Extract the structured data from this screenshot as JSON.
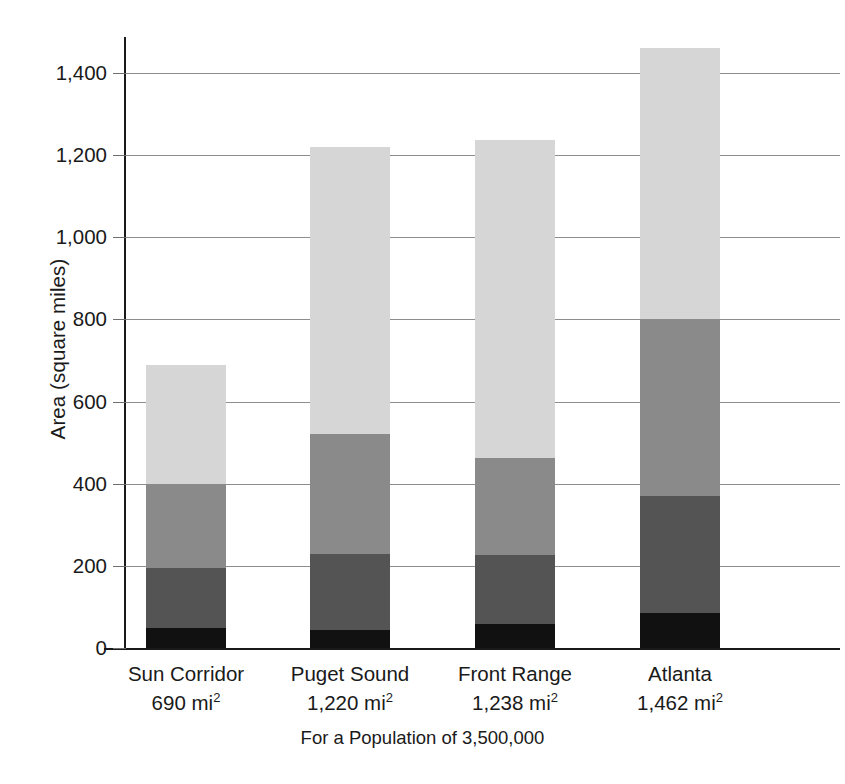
{
  "chart_data": {
    "type": "bar",
    "subtype": "stacked-bar",
    "title": "",
    "xlabel": "For a Population of 3,500,000",
    "ylabel": "Area (square miles)",
    "ylim": [
      0,
      1500
    ],
    "ytick_values": [
      0,
      200,
      400,
      600,
      800,
      1000,
      1200,
      1400
    ],
    "ytick_labels": [
      "0",
      "200",
      "400",
      "600",
      "800",
      "1,000",
      "1,200",
      "1,400"
    ],
    "grid": true,
    "legend": "none",
    "categories": [
      "Sun Corridor",
      "Puget Sound",
      "Front Range",
      "Atlanta"
    ],
    "category_sublabels": [
      "690 mi",
      "1,220 mi",
      "1,238 mi",
      "1,462 mi"
    ],
    "category_sublabel_unit_exponent": "2",
    "totals": [
      690,
      1220,
      1238,
      1462
    ],
    "series": [
      {
        "name": "segment-1",
        "color": "#111111",
        "values": [
          48,
          45,
          58,
          85
        ]
      },
      {
        "name": "segment-2",
        "color": "#545454",
        "values": [
          147,
          185,
          168,
          285
        ]
      },
      {
        "name": "segment-3",
        "color": "#8a8a8a",
        "values": [
          205,
          290,
          237,
          430
        ]
      },
      {
        "name": "segment-4",
        "color": "#d6d6d6",
        "values": [
          290,
          700,
          775,
          662
        ]
      }
    ],
    "cumulative_boundaries": [
      [
        48,
        195,
        400,
        690
      ],
      [
        45,
        230,
        520,
        1220
      ],
      [
        58,
        226,
        463,
        1238
      ],
      [
        85,
        370,
        800,
        1462
      ]
    ]
  },
  "colors": {
    "segment_1": "#111111",
    "segment_2": "#545454",
    "segment_3": "#8a8a8a",
    "segment_4": "#d6d6d6",
    "axis": "#1a1a1a",
    "gridline": "#8d8d8d",
    "background": "#ffffff"
  }
}
